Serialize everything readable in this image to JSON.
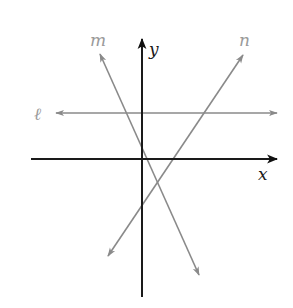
{
  "diagram": {
    "type": "coordinate-plane-lines",
    "axes": {
      "x_label": "x",
      "y_label": "y",
      "color": "#1a1a1a"
    },
    "lines": [
      {
        "name": "line-l",
        "label": "ℓ",
        "color": "#8a8a8a",
        "description": "horizontal line above x-axis"
      },
      {
        "name": "line-m",
        "label": "m",
        "color": "#8a8a8a",
        "description": "line with negative slope"
      },
      {
        "name": "line-n",
        "label": "n",
        "color": "#8a8a8a",
        "description": "line with positive slope"
      }
    ],
    "label_color": "#9a9a9a"
  }
}
